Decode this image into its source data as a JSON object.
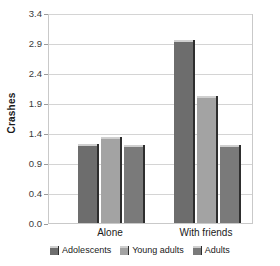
{
  "chart_data": {
    "type": "bar",
    "title": "",
    "xlabel": "",
    "ylabel": "Crashes",
    "categories": [
      "Alone",
      "With friends"
    ],
    "series": [
      {
        "name": "Adolescents",
        "values": [
          1.28,
          2.97
        ],
        "color": "#6d6d6d"
      },
      {
        "name": "Young adults",
        "values": [
          1.4,
          2.05
        ],
        "color": "#a3a3a3"
      },
      {
        "name": "Adults",
        "values": [
          1.26,
          1.26
        ],
        "color": "#7a7a7a"
      }
    ],
    "ytick_labels": [
      "0.0",
      "0.4",
      "0.9",
      "1.4",
      "1.9",
      "2.4",
      "2.9",
      "3.4"
    ],
    "ytick_values": [
      0.0,
      0.486,
      0.971,
      1.457,
      1.943,
      2.429,
      2.914,
      3.4
    ],
    "ylim": [
      0,
      3.4
    ],
    "grid": true,
    "legend_position": "bottom"
  },
  "legend": {
    "items": [
      {
        "label": "Adolescents"
      },
      {
        "label": "Young adults"
      },
      {
        "label": "Adults"
      }
    ]
  },
  "axis": {
    "y_title": "Crashes",
    "x_categories": [
      "Alone",
      "With friends"
    ]
  }
}
